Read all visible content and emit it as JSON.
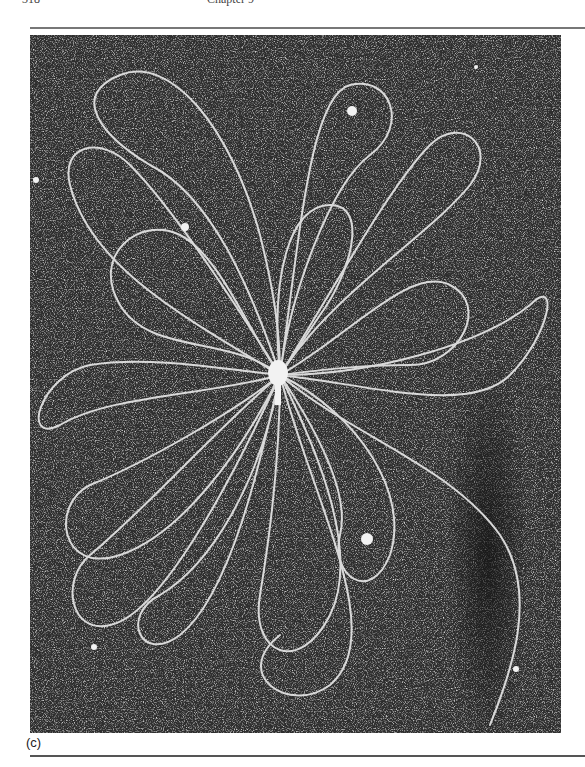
{
  "page": {
    "running_head": {
      "page_number": "318",
      "title": "Chapter 9"
    },
    "figure": {
      "panel_label": "(c)",
      "content": "Electron micrograph of DNA strands released from a burst phage particle, spreading as long looped filaments around a central head",
      "colors": {
        "background": "#2b2b2b",
        "filaments": "#e8e8e8",
        "rule": "#666666"
      }
    }
  }
}
